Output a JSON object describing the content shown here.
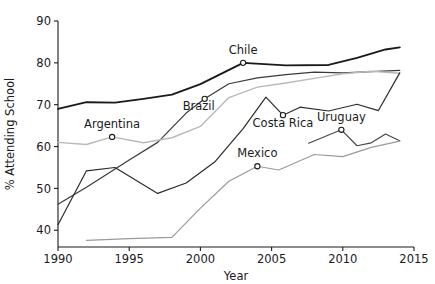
{
  "chart_data": {
    "type": "line",
    "title": "",
    "xlabel": "Year",
    "ylabel": "% Attending School",
    "xlim": [
      1990,
      2015
    ],
    "ylim": [
      36,
      90
    ],
    "grid": false,
    "legend_position": "inline-labels",
    "xticks": [
      1990,
      1995,
      2000,
      2005,
      2010,
      2015
    ],
    "yticks": [
      40,
      50,
      60,
      70,
      80,
      90
    ],
    "series": [
      {
        "name": "Chile",
        "color": "#1a1a1a",
        "width": 1.9,
        "label_point": {
          "x": 2003,
          "y": 80.0
        },
        "label_dx": 0,
        "label_dy": -9,
        "x": [
          1990,
          1992,
          1994,
          1996,
          1998,
          2000,
          2003,
          2006,
          2009,
          2011,
          2013,
          2014
        ],
        "y": [
          69.0,
          70.6,
          70.5,
          71.4,
          72.4,
          74.9,
          80.0,
          79.4,
          79.5,
          81.2,
          83.2,
          83.7
        ]
      },
      {
        "name": "Brazil",
        "color": "#3a3a3a",
        "width": 1.2,
        "label_point": {
          "x": 2000.3,
          "y": 71.4
        },
        "label_dx": -6,
        "label_dy": 11,
        "x": [
          1990,
          1992,
          1995,
          1997,
          1999,
          2000.3,
          2002,
          2004,
          2006,
          2008,
          2010,
          2012,
          2014
        ],
        "y": [
          46.2,
          50.3,
          56.8,
          61.0,
          68.0,
          71.4,
          75.0,
          76.4,
          77.2,
          77.8,
          77.6,
          77.9,
          78.2
        ]
      },
      {
        "name": "Argentina",
        "color": "#b9b9b9",
        "width": 1.4,
        "label_point": {
          "x": 1993.8,
          "y": 62.3
        },
        "label_dx": 0,
        "label_dy": -9,
        "x": [
          1990,
          1992,
          1993.8,
          1996,
          1998,
          2000,
          2002,
          2004,
          2006,
          2008,
          2010,
          2012,
          2014
        ],
        "y": [
          61.0,
          60.5,
          62.3,
          60.9,
          62.1,
          64.8,
          71.7,
          74.2,
          75.2,
          76.3,
          77.4,
          78.0,
          77.5
        ]
      },
      {
        "name": "Costa Rica",
        "color": "#2b2b2b",
        "width": 1.2,
        "label_point": {
          "x": 2005.8,
          "y": 67.5
        },
        "label_dx": 0,
        "label_dy": 12,
        "x": [
          1990,
          1992,
          1994,
          1997,
          1999,
          2001,
          2003,
          2004.6,
          2005.8,
          2007,
          2009,
          2011,
          2012.5,
          2014
        ],
        "y": [
          41.3,
          54.2,
          55.0,
          48.8,
          51.3,
          56.3,
          64.3,
          71.8,
          67.5,
          69.4,
          68.5,
          70.1,
          68.6,
          77.6
        ]
      },
      {
        "name": "Uruguay",
        "color": "#474747",
        "width": 1.2,
        "label_point": {
          "x": 2009.9,
          "y": 64.0
        },
        "label_dx": 0,
        "label_dy": -9,
        "x": [
          2007.6,
          2009.9,
          2011,
          2012,
          2013,
          2014
        ],
        "y": [
          60.8,
          64.0,
          60.2,
          60.9,
          63.0,
          61.4
        ]
      },
      {
        "name": "Mexico",
        "color": "#9a9a9a",
        "width": 1.2,
        "label_point": {
          "x": 2004,
          "y": 55.3
        },
        "label_dx": 0,
        "label_dy": -9,
        "x": [
          1992,
          1995,
          1998,
          2000,
          2002,
          2004,
          2005.5,
          2008,
          2010,
          2012,
          2014
        ],
        "y": [
          37.6,
          38.0,
          38.3,
          45.3,
          51.7,
          55.3,
          54.4,
          58.1,
          57.6,
          59.8,
          61.3
        ]
      }
    ]
  },
  "axes": {
    "ylabel": "% Attending School",
    "xlabel": "Year",
    "ytick_labels": [
      "90",
      "80",
      "70",
      "60",
      "50",
      "40"
    ],
    "xtick_labels": [
      "1990",
      "1995",
      "2000",
      "2005",
      "2010",
      "2015"
    ]
  },
  "labels": {
    "chile": "Chile",
    "brazil": "Brazil",
    "argentina": "Argentina",
    "costa_rica": "Costa Rica",
    "uruguay": "Uruguay",
    "mexico": "Mexico"
  }
}
